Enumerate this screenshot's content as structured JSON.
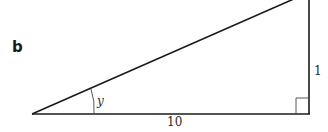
{
  "figure": {
    "part_label": "b",
    "shape": "right triangle",
    "angle_label": "y",
    "sides": {
      "adjacent": "10",
      "opposite": "1"
    },
    "right_angle_marker": true,
    "line_color": "#1a1a1a"
  }
}
